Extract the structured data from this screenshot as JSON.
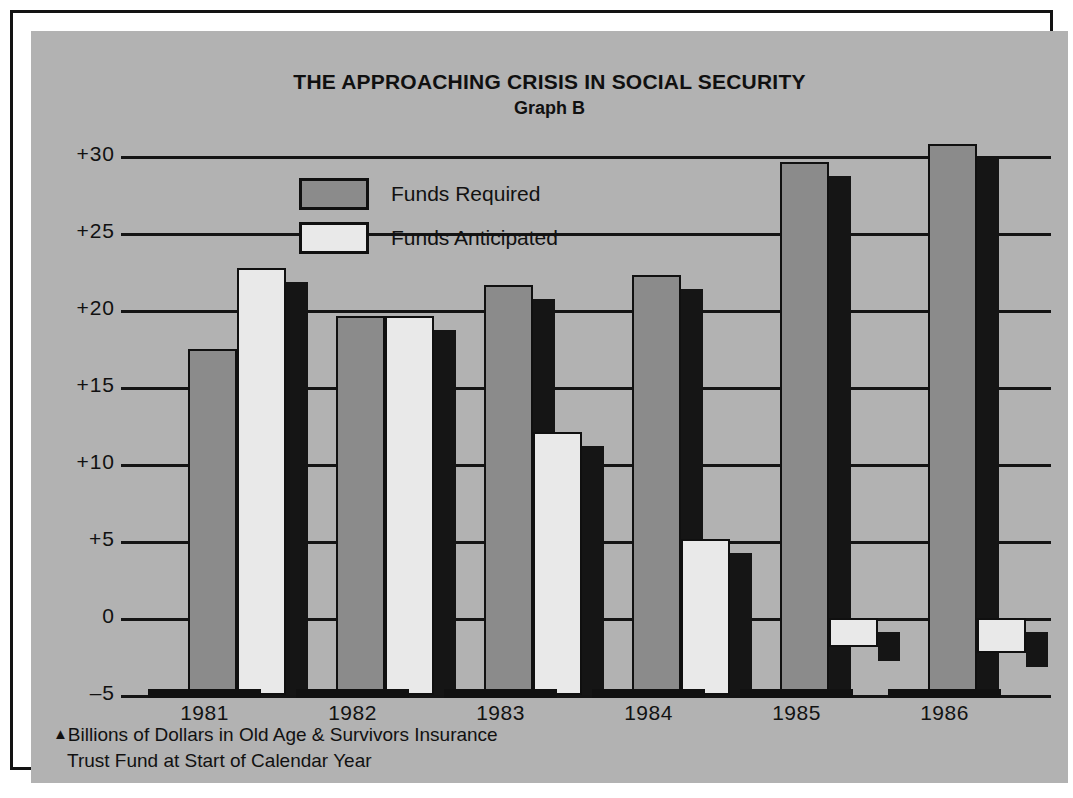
{
  "chart_data": {
    "type": "bar",
    "title": "THE APPROACHING CRISIS IN SOCIAL SECURITY",
    "subtitle": "Graph B",
    "xlabel": "",
    "ylabel": "",
    "categories": [
      "1981",
      "1982",
      "1983",
      "1984",
      "1985",
      "1986"
    ],
    "series": [
      {
        "name": "Funds Required",
        "values": [
          17.5,
          19.6,
          21.6,
          22.3,
          29.6,
          30.8
        ]
      },
      {
        "name": "Funds Anticipated",
        "values": [
          22.7,
          19.6,
          12.1,
          5.1,
          -1.9,
          -2.3
        ]
      }
    ],
    "ylim": [
      -5,
      32
    ],
    "yticks": [
      "+30",
      "+25",
      "+20",
      "+15",
      "+10",
      "+5",
      "0",
      "-5"
    ],
    "ytick_values": [
      30,
      25,
      20,
      15,
      10,
      5,
      0,
      -5
    ],
    "grid": true,
    "legend_position": "upper-left-inside",
    "annotations": [
      "Billions of Dollars in Old Age & Survivors  Insurance",
      "Trust Fund at Start of Calendar Year"
    ]
  },
  "legend": {
    "items": [
      {
        "label": "Funds Required",
        "color": "#8b8b8b"
      },
      {
        "label": "Funds Anticipated",
        "color": "#e9e9e9"
      }
    ]
  },
  "footnote": {
    "marker": "▲",
    "line1": "Billions of Dollars in Old Age & Survivors  Insurance",
    "line2": "Trust Fund at Start of Calendar Year"
  },
  "colors": {
    "panel_background": "#b2b2b2",
    "ink": "#111111",
    "required": "#8b8b8b",
    "anticipated": "#e9e9e9",
    "shadow": "#151515"
  }
}
